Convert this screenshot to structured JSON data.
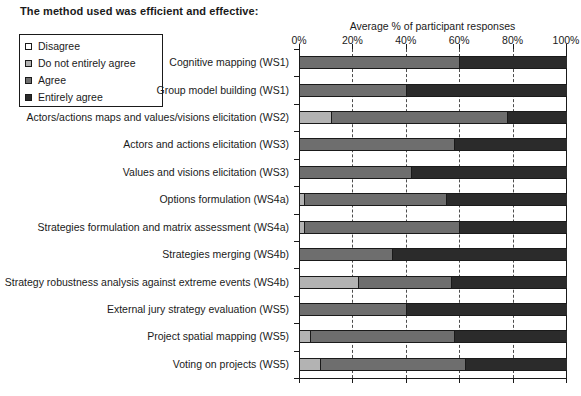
{
  "title": "The method used was efficient and effective:",
  "legend": {
    "items": [
      {
        "label": "Disagree",
        "color": "#ffffff"
      },
      {
        "label": "Do not entirely agree",
        "color": "#b3b3b3"
      },
      {
        "label": "Agree",
        "color": "#6e6e6e"
      },
      {
        "label": "Entirely agree",
        "color": "#2b2b2b"
      }
    ]
  },
  "chart_data": {
    "type": "bar",
    "orientation": "horizontal",
    "stacked": true,
    "percent_stacked": true,
    "title": "The method used was efficient and effective:",
    "xlabel": "Average % of participant responses",
    "ylabel": "",
    "xlim": [
      0,
      100
    ],
    "xticks": [
      0,
      20,
      40,
      60,
      80,
      100
    ],
    "xtick_labels": [
      "0%",
      "20%",
      "40%",
      "60%",
      "80%",
      "100%"
    ],
    "xaxis_position": "top",
    "grid": true,
    "grid_axis": "x",
    "grid_style": "dashed",
    "legend_position": "upper-left-outside",
    "categories": [
      "Cognitive mapping (WS1)",
      "Group model building (WS1)",
      "Actors/actions maps and values/visions elicitation (WS2)",
      "Actors and actions elicitation (WS3)",
      "Values and visions elicitation (WS3)",
      "Options formulation (WS4a)",
      "Strategies formulation and matrix assessment (WS4a)",
      "Strategies merging (WS4b)",
      "Strategy robustness analysis against extreme events (WS4b)",
      "External jury strategy evaluation (WS5)",
      "Project spatial mapping (WS5)",
      "Voting on projects (WS5)"
    ],
    "series": [
      {
        "name": "Disagree",
        "color": "#ffffff",
        "values": [
          0,
          0,
          0,
          0,
          0,
          0,
          0,
          0,
          0,
          0,
          0,
          0
        ]
      },
      {
        "name": "Do not entirely agree",
        "color": "#b3b3b3",
        "values": [
          0,
          0,
          12,
          0,
          0,
          2,
          2,
          0,
          22,
          0,
          4,
          8
        ]
      },
      {
        "name": "Agree",
        "color": "#6e6e6e",
        "values": [
          60,
          40,
          66,
          58,
          42,
          53,
          58,
          35,
          35,
          40,
          54,
          54
        ]
      },
      {
        "name": "Entirely agree",
        "color": "#2b2b2b",
        "values": [
          40,
          60,
          22,
          42,
          58,
          45,
          40,
          65,
          43,
          60,
          42,
          38
        ]
      }
    ]
  }
}
